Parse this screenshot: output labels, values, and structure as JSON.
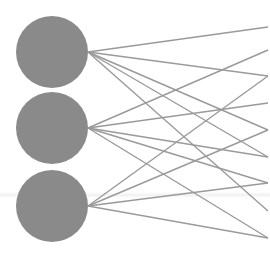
{
  "diagram": {
    "type": "neural-network-layer-connections",
    "node_color": "#8a8a8a",
    "edge_color": "#9a9a9a",
    "edge_width": 1.4,
    "nodes": [
      {
        "id": "n1",
        "cx": 52,
        "cy": 52,
        "r": 36
      },
      {
        "id": "n2",
        "cx": 52,
        "cy": 128,
        "r": 36
      },
      {
        "id": "n3",
        "cx": 52,
        "cy": 206,
        "r": 36
      }
    ],
    "target_x": 268,
    "edges": [
      {
        "from": "n1",
        "y1": 52,
        "y2": 27
      },
      {
        "from": "n1",
        "y1": 52,
        "y2": 76
      },
      {
        "from": "n1",
        "y1": 52,
        "y2": 130
      },
      {
        "from": "n1",
        "y1": 52,
        "y2": 157
      },
      {
        "from": "n1",
        "y1": 52,
        "y2": 211
      },
      {
        "from": "n2",
        "y1": 128,
        "y2": 50
      },
      {
        "from": "n2",
        "y1": 128,
        "y2": 103
      },
      {
        "from": "n2",
        "y1": 128,
        "y2": 157
      },
      {
        "from": "n2",
        "y1": 128,
        "y2": 183
      },
      {
        "from": "n2",
        "y1": 128,
        "y2": 238
      },
      {
        "from": "n3",
        "y1": 206,
        "y2": 76
      },
      {
        "from": "n3",
        "y1": 206,
        "y2": 130
      },
      {
        "from": "n3",
        "y1": 206,
        "y2": 183
      },
      {
        "from": "n3",
        "y1": 206,
        "y2": 238
      }
    ]
  }
}
